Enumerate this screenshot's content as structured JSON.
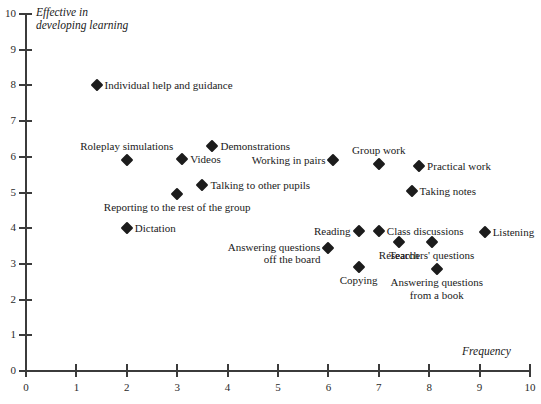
{
  "chart_data": {
    "type": "scatter",
    "title": "",
    "xlabel": "Frequency",
    "ylabel": "Effective in\ndeveloping learning",
    "xlim": [
      0,
      10
    ],
    "ylim": [
      0,
      10
    ],
    "xticks": [
      "0",
      "1",
      "2",
      "3",
      "4",
      "5",
      "6",
      "7",
      "8",
      "9",
      "10"
    ],
    "yticks": [
      "0",
      "1",
      "2",
      "3",
      "4",
      "5",
      "6",
      "7",
      "8",
      "9",
      "10"
    ],
    "grid": false,
    "legend": "none",
    "marker": "diamond",
    "marker_color": "#1c1c1c",
    "axis_color": "#3b3b3b",
    "points": [
      {
        "label": "Individual help and guidance",
        "x": 1.4,
        "y": 8.0,
        "label_pos": "right"
      },
      {
        "label": "Demonstrations",
        "x": 3.7,
        "y": 6.3,
        "label_pos": "right"
      },
      {
        "label": "Videos",
        "x": 3.1,
        "y": 5.95,
        "label_pos": "right"
      },
      {
        "label": "Roleplay simulations",
        "x": 2.0,
        "y": 5.9,
        "label_pos": "above"
      },
      {
        "label": "Working in pairs",
        "x": 6.1,
        "y": 5.9,
        "label_pos": "left"
      },
      {
        "label": "Group work",
        "x": 7.0,
        "y": 5.8,
        "label_pos": "above"
      },
      {
        "label": "Practical work",
        "x": 7.8,
        "y": 5.75,
        "label_pos": "right"
      },
      {
        "label": "Talking to other pupils",
        "x": 3.5,
        "y": 5.2,
        "label_pos": "right"
      },
      {
        "label": "Taking notes",
        "x": 7.65,
        "y": 5.05,
        "label_pos": "right"
      },
      {
        "label": "Reporting to the rest of the group",
        "x": 3.0,
        "y": 4.95,
        "label_pos": "below"
      },
      {
        "label": "Dictation",
        "x": 2.0,
        "y": 4.0,
        "label_pos": "right"
      },
      {
        "label": "Reading",
        "x": 6.6,
        "y": 3.92,
        "label_pos": "left"
      },
      {
        "label": "Class discussions",
        "x": 7.0,
        "y": 3.92,
        "label_pos": "right"
      },
      {
        "label": "Listening",
        "x": 9.1,
        "y": 3.9,
        "label_pos": "right"
      },
      {
        "label": "Research",
        "x": 7.4,
        "y": 3.6,
        "label_pos": "below"
      },
      {
        "label": "Teachers' questions",
        "x": 8.05,
        "y": 3.6,
        "label_pos": "below"
      },
      {
        "label": "Answering questions\noff the board",
        "x": 6.0,
        "y": 3.45,
        "label_pos": "left-below"
      },
      {
        "label": "Copying",
        "x": 6.6,
        "y": 2.9,
        "label_pos": "below"
      },
      {
        "label": "Answering questions\nfrom a book",
        "x": 8.15,
        "y": 2.85,
        "label_pos": "below"
      }
    ]
  }
}
